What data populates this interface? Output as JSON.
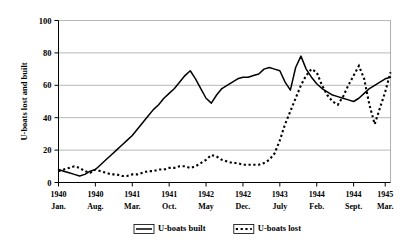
{
  "chart_data": {
    "type": "line",
    "title": "",
    "xlabel": "",
    "ylabel": "U-boats lost and built",
    "ylim": [
      0,
      100
    ],
    "yticks": [
      0,
      20,
      40,
      60,
      80,
      100
    ],
    "grid": true,
    "legend_position": "bottom-center",
    "x_tick_labels": [
      {
        "year": "1940",
        "month": "Jan."
      },
      {
        "year": "1940",
        "month": "Aug."
      },
      {
        "year": "1941",
        "month": "Mar."
      },
      {
        "year": "1941",
        "month": "Oct."
      },
      {
        "year": "1942",
        "month": "May"
      },
      {
        "year": "1942",
        "month": "Dec."
      },
      {
        "year": "1943",
        "month": "July"
      },
      {
        "year": "1944",
        "month": "Feb."
      },
      {
        "year": "1944",
        "month": "Sept."
      },
      {
        "year": "1945",
        "month": "Mar."
      }
    ],
    "x_tick_indices": [
      0,
      7,
      14,
      21,
      28,
      35,
      42,
      49,
      56,
      62
    ],
    "x": [
      0,
      1,
      2,
      3,
      4,
      5,
      6,
      7,
      8,
      9,
      10,
      11,
      12,
      13,
      14,
      15,
      16,
      17,
      18,
      19,
      20,
      21,
      22,
      23,
      24,
      25,
      26,
      27,
      28,
      29,
      30,
      31,
      32,
      33,
      34,
      35,
      36,
      37,
      38,
      39,
      40,
      41,
      42,
      43,
      44,
      45,
      46,
      47,
      48,
      49,
      50,
      51,
      52,
      53,
      54,
      55,
      56,
      57,
      58,
      59,
      60,
      61,
      62,
      63
    ],
    "series": [
      {
        "name": "U-boats built",
        "style": "solid",
        "values": [
          8,
          7,
          6,
          5,
          4,
          5,
          7,
          8,
          11,
          14,
          17,
          20,
          23,
          26,
          29,
          33,
          37,
          41,
          45,
          48,
          52,
          55,
          58,
          62,
          66,
          69,
          64,
          58,
          52,
          49,
          54,
          58,
          60,
          62,
          64,
          65,
          65,
          66,
          67,
          70,
          71,
          70,
          69,
          62,
          57,
          71,
          78,
          70,
          65,
          61,
          58,
          56,
          54,
          53,
          52,
          51,
          50,
          52,
          55,
          58,
          60,
          62,
          64,
          65
        ]
      },
      {
        "name": "U-boats lost",
        "style": "dotted",
        "values": [
          7,
          8,
          9,
          10,
          9,
          7,
          6,
          8,
          7,
          6,
          5,
          5,
          4,
          4,
          5,
          5,
          6,
          7,
          7,
          8,
          8,
          9,
          9,
          10,
          10,
          9,
          10,
          12,
          14,
          17,
          16,
          14,
          13,
          12,
          12,
          11,
          11,
          11,
          11,
          12,
          14,
          18,
          26,
          36,
          44,
          52,
          60,
          66,
          70,
          68,
          60,
          54,
          50,
          48,
          53,
          60,
          66,
          72,
          64,
          48,
          36,
          46,
          56,
          68
        ]
      }
    ]
  },
  "legend": {
    "items": [
      {
        "label": "U-boats built",
        "style": "solid"
      },
      {
        "label": "U-boats lost",
        "style": "dotted"
      }
    ]
  }
}
